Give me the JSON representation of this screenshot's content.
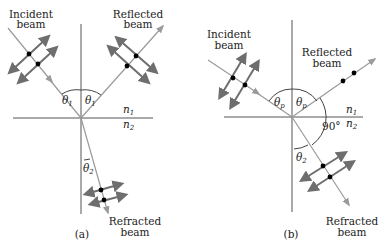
{
  "diagram_a": {
    "caption": "(a)",
    "incident_label": [
      "Incident",
      "beam"
    ],
    "reflected_label": [
      "Reflected",
      "beam"
    ],
    "refracted_label": [
      "Refracted",
      "beam"
    ],
    "theta_incident": "θ",
    "theta_incident_sub": "1",
    "theta_reflected": "θ",
    "theta_reflected_sub": "1",
    "theta_refracted": "θ",
    "theta_refracted_sub": "2",
    "n_upper": "n",
    "n_upper_sub": "1",
    "n_lower": "n",
    "n_lower_sub": "2"
  },
  "diagram_b": {
    "caption": "(b)",
    "incident_label": [
      "Incident",
      "beam"
    ],
    "reflected_label": [
      "Reflected",
      "beam"
    ],
    "refracted_label": [
      "Refracted",
      "beam"
    ],
    "theta_incident": "θ",
    "theta_incident_sub": "p",
    "theta_reflected": "θ",
    "theta_reflected_sub": "p",
    "theta_refracted": "θ",
    "theta_refracted_sub": "2",
    "angle_right": "90°",
    "n_upper": "n",
    "n_upper_sub": "1",
    "n_lower": "n",
    "n_lower_sub": "2"
  },
  "colors": {
    "ray": "#9a9a9a",
    "polarization_arrow": "#6e6e6e",
    "dot": "#000000",
    "line": "#555555"
  }
}
